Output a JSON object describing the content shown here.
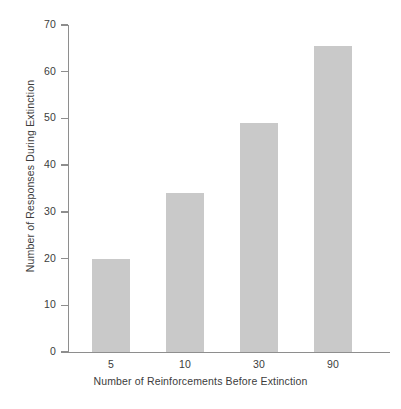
{
  "chart_data": {
    "type": "bar",
    "title": "",
    "xlabel": "Number of Reinforcements Before Extinction",
    "ylabel": "Number of Responses During Extinction",
    "categories": [
      "5",
      "10",
      "30",
      "90"
    ],
    "values": [
      20,
      34,
      49,
      65.5
    ],
    "series": [
      {
        "name": "Responses During Extinction",
        "values": [
          20,
          34,
          49,
          65.5
        ]
      }
    ],
    "ylim": [
      0,
      70
    ],
    "y_ticks": [
      0,
      10,
      20,
      30,
      40,
      50,
      60,
      70
    ],
    "y_tick_labels": [
      "0",
      "10",
      "20",
      "30",
      "40",
      "50",
      "60",
      "70"
    ],
    "x_tick_labels": [
      "5",
      "10",
      "30",
      "90"
    ],
    "grid": false,
    "legend": false,
    "legend_position": "none",
    "colors": {
      "bar_fill": "#c9c9c9",
      "axis": "#8e8e8e",
      "text": "#3c3c3c",
      "background": "#ffffff"
    }
  }
}
